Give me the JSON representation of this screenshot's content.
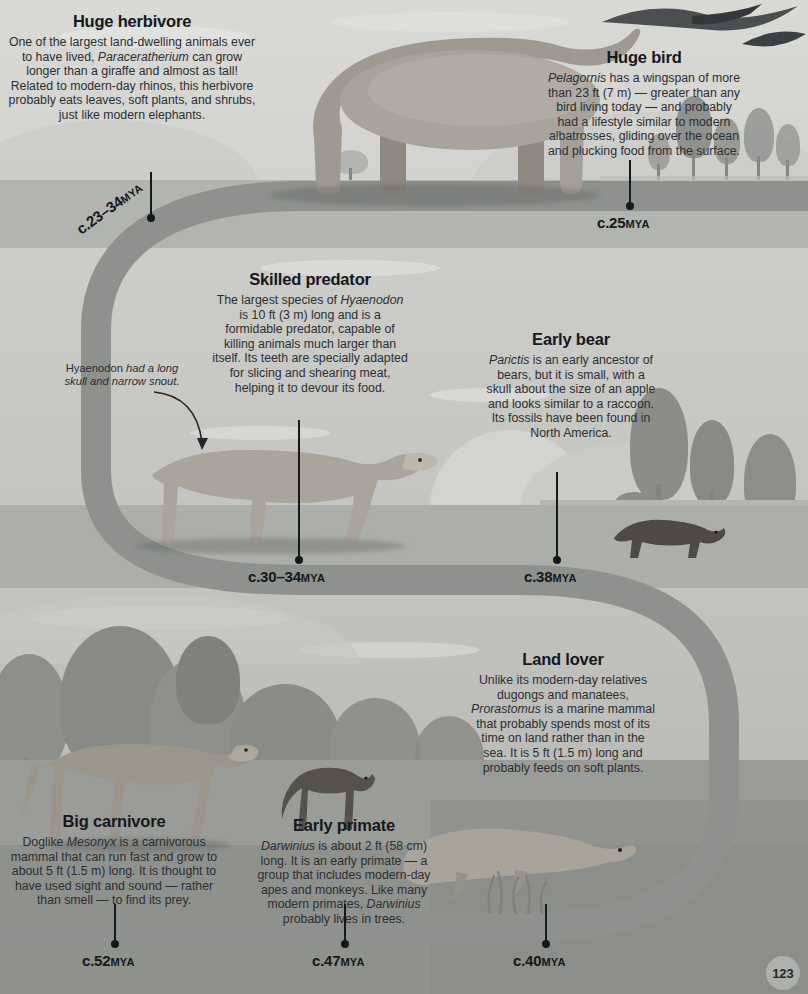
{
  "page": {
    "number": "123"
  },
  "colors": {
    "path": "#8e918d",
    "ink": "#15181c",
    "body_text": "#2b2e32",
    "band_top": "#d9dad6",
    "band_mid": "#cccdc9",
    "band_bottom": "#b7b8b4"
  },
  "callouts": [
    {
      "id": "huge-herbivore",
      "title": "Huge herbivore",
      "body": "One of the largest land-dwelling animals ever to have lived, <i>Paraceratherium</i> can grow longer than a giraffe and almost as tall! Related to modern-day rhinos, this herbivore probably eats leaves, soft plants, and shrubs, just like modern elephants.",
      "species": "Paraceratherium"
    },
    {
      "id": "huge-bird",
      "title": "Huge bird",
      "body": "<i>Pelagornis</i> has a wingspan of more than 23 ft (7 m) — greater than any bird living today — and probably had a lifestyle similar to modern albatrosses, gliding over the ocean and plucking food from the surface.",
      "species": "Pelagornis"
    },
    {
      "id": "skilled-predator",
      "title": "Skilled predator",
      "body": "The largest species of <i>Hyaenodon</i> is 10 ft (3 m) long and is a formidable predator, capable of killing animals much larger than itself. Its teeth are specially adapted for slicing and shearing meat, helping it to devour its food.",
      "species": "Hyaenodon"
    },
    {
      "id": "early-bear",
      "title": "Early bear",
      "body": "<i>Parictis</i> is an early ancestor of bears, but it is small, with a skull about the size of an apple and looks similar to a raccoon. Its fossils have been found in North America.",
      "species": "Parictis"
    },
    {
      "id": "land-lover",
      "title": "Land lover",
      "body": "Unlike its modern-day relatives dugongs and manatees, <i>Prorastomus</i> is a marine mammal that probably spends most of its time on land rather than in the sea. It is 5 ft (1.5 m) long and probably feeds on soft plants.",
      "species": "Prorastomus"
    },
    {
      "id": "big-carnivore",
      "title": "Big carnivore",
      "body": "Doglike <i>Mesonyx</i> is a carnivorous mammal that can run fast and grow to about 5 ft (1.5 m) long. It is thought to have used sight and sound — rather than smell — to find its prey.",
      "species": "Mesonyx"
    },
    {
      "id": "early-primate",
      "title": "Early primate",
      "body": "<i>Darwinius</i> is about 2 ft (58 cm) long. It is an early primate — a group that includes modern-day apes and monkeys. Like many modern primates, <i>Darwinius</i> probably lives in trees.",
      "species": "Darwinius"
    }
  ],
  "annotation": {
    "id": "hyaenodon-skull-note",
    "text": "Hyaenodon <i>had a long skull and narrow snout.</i>"
  },
  "dates": [
    {
      "id": "date-23-34",
      "value": "c.23–34",
      "unit": "MYA",
      "rotated": true
    },
    {
      "id": "date-25",
      "value": "c.25",
      "unit": "MYA",
      "rotated": false
    },
    {
      "id": "date-30-34",
      "value": "c.30–34",
      "unit": "MYA",
      "rotated": false
    },
    {
      "id": "date-38",
      "value": "c.38",
      "unit": "MYA",
      "rotated": false
    },
    {
      "id": "date-52",
      "value": "c.52",
      "unit": "MYA",
      "rotated": false
    },
    {
      "id": "date-47",
      "value": "c.47",
      "unit": "MYA",
      "rotated": false
    },
    {
      "id": "date-40",
      "value": "c.40",
      "unit": "MYA",
      "rotated": false
    }
  ]
}
